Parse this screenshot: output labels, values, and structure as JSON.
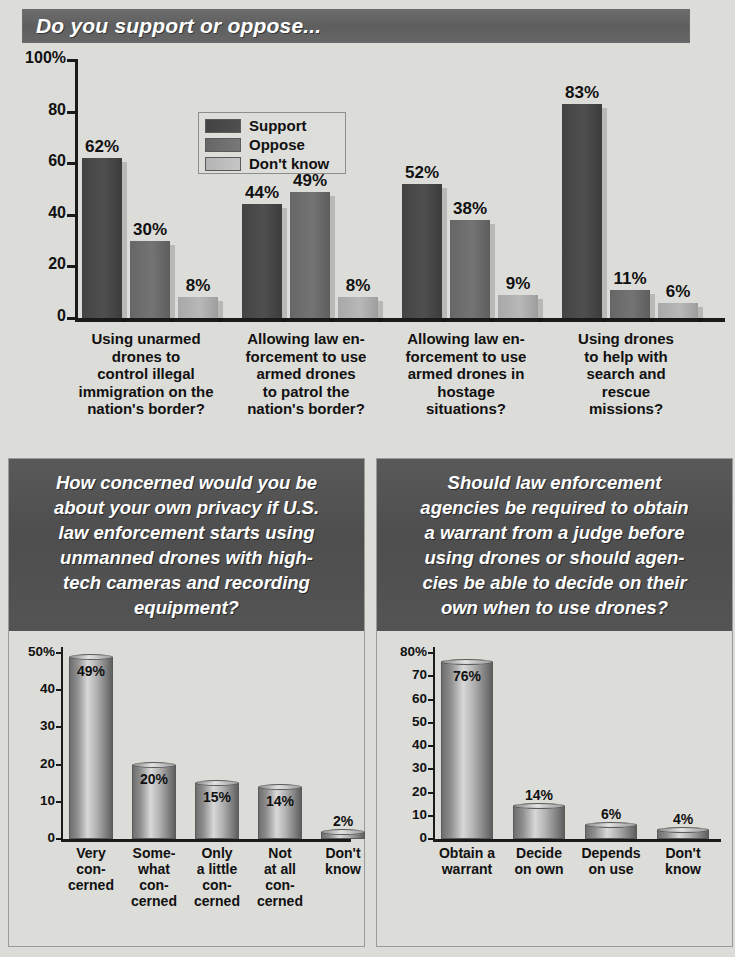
{
  "header": {
    "title": "Do you support or oppose..."
  },
  "chart_data": [
    {
      "type": "bar",
      "title": "Do you support or oppose...",
      "xlabel": "",
      "ylabel": "",
      "ylim": [
        0,
        100
      ],
      "yticks": [
        "0",
        "20",
        "40",
        "60",
        "80",
        "100%"
      ],
      "grid": false,
      "legend_position": "top-center",
      "categories": [
        "Using unarmed drones to control illegal immigration on the nation's border?",
        "Allowing law enforcement to use armed drones to patrol the nation's border?",
        "Allowing law enforcement to use armed drones in hostage situations?",
        "Using drones to help with search and rescue missions?"
      ],
      "category_lines": [
        [
          "Using unarmed",
          "drones to",
          "control illegal",
          "immigration on the",
          "nation's border?"
        ],
        [
          "Allowing law en-",
          "forcement to use",
          "armed drones",
          "to patrol the",
          "nation's border?"
        ],
        [
          "Allowing law en-",
          "forcement to use",
          "armed drones in",
          "hostage",
          "situations?"
        ],
        [
          "Using drones",
          "to help with",
          "search and",
          "rescue",
          "missions?"
        ]
      ],
      "series": [
        {
          "name": "Support",
          "values": [
            62,
            44,
            52,
            83
          ],
          "labels": [
            "62%",
            "44%",
            "52%",
            "83%"
          ],
          "color": "#474747"
        },
        {
          "name": "Oppose",
          "values": [
            30,
            49,
            38,
            11
          ],
          "labels": [
            "30%",
            "49%",
            "38%",
            "11%"
          ],
          "color": "#6e6e6e"
        },
        {
          "name": "Don't know",
          "values": [
            8,
            8,
            9,
            6
          ],
          "labels": [
            "8%",
            "8%",
            "9%",
            "6%"
          ],
          "color": "#b2b2b2"
        }
      ]
    },
    {
      "type": "bar",
      "title": "How concerned would you be about your own privacy if U.S. law enforcement starts using unmanned drones with high-tech cameras and recording equipment?",
      "title_lines": [
        "How concerned would you be",
        "about your own privacy if U.S.",
        "law enforcement starts using",
        "unmanned drones with high-",
        "tech cameras and recording",
        "equipment?"
      ],
      "xlabel": "",
      "ylabel": "",
      "ylim": [
        0,
        50
      ],
      "yticks": [
        "0",
        "10",
        "20",
        "30",
        "40",
        "50%"
      ],
      "grid": false,
      "categories": [
        "Very concerned",
        "Somewhat concerned",
        "Only a little concerned",
        "Not at all concerned",
        "Don't know"
      ],
      "category_lines": [
        [
          "Very",
          "con-",
          "cerned"
        ],
        [
          "Some-",
          "what",
          "con-",
          "cerned"
        ],
        [
          "Only",
          "a little",
          "con-",
          "cerned"
        ],
        [
          "Not",
          "at all",
          "con-",
          "cerned"
        ],
        [
          "Don't",
          "know"
        ]
      ],
      "values": [
        49,
        20,
        15,
        14,
        2
      ],
      "labels": [
        "49%",
        "20%",
        "15%",
        "14%",
        "2%"
      ]
    },
    {
      "type": "bar",
      "title": "Should law enforcement agencies be required to obtain a warrant from a judge before using drones or should agencies be able to decide on their own when to use drones?",
      "title_lines": [
        "Should law enforcement",
        "agencies be required to obtain",
        "a warrant from a judge before",
        "using drones or should agen-",
        "cies be able to decide on their",
        "own when to use drones?"
      ],
      "xlabel": "",
      "ylabel": "",
      "ylim": [
        0,
        80
      ],
      "yticks": [
        "0",
        "10",
        "20",
        "30",
        "40",
        "50",
        "60",
        "70",
        "80%"
      ],
      "grid": false,
      "categories": [
        "Obtain a warrant",
        "Decide on own",
        "Depends on use",
        "Don't know"
      ],
      "category_lines": [
        [
          "Obtain a",
          "warrant"
        ],
        [
          "Decide",
          "on own"
        ],
        [
          "Depends",
          "on use"
        ],
        [
          "Don't",
          "know"
        ]
      ],
      "values": [
        76,
        14,
        6,
        4
      ],
      "labels": [
        "76%",
        "14%",
        "6%",
        "4%"
      ]
    }
  ],
  "colors": {
    "header_bar": "#5e5e5e",
    "panel_head": "#515151",
    "page_background": "#dcdcd8",
    "support": "#474747",
    "oppose": "#6e6e6e",
    "dont_know": "#b2b2b2"
  }
}
